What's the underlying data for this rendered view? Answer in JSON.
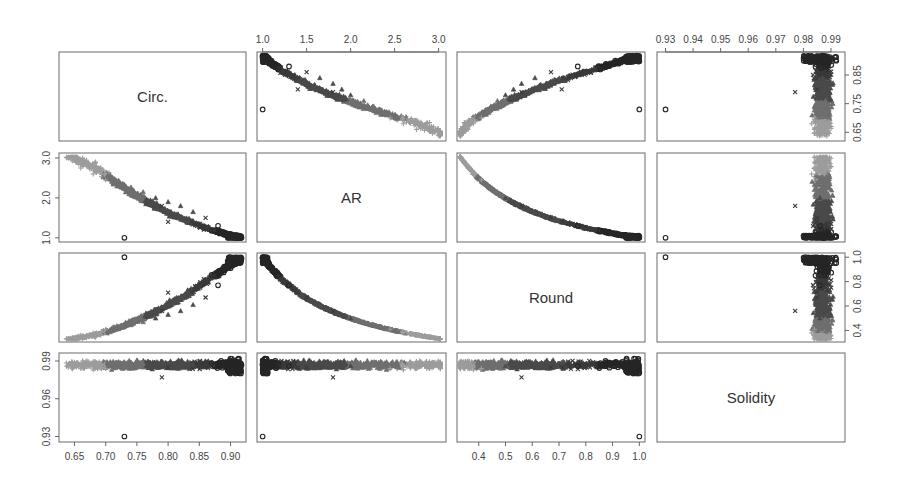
{
  "chart_data": {
    "type": "scatter",
    "subtype": "scatter_matrix",
    "title": "",
    "variables": [
      "Circ.",
      "AR",
      "Round",
      "Solidity"
    ],
    "ranges": {
      "Circ.": [
        0.63,
        0.92
      ],
      "AR": [
        0.97,
        3.05
      ],
      "Round": [
        0.33,
        1.01
      ],
      "Solidity": [
        0.928,
        0.994
      ]
    },
    "axes": {
      "top": [
        {
          "column": 1,
          "variable": "AR",
          "ticks": [
            "1.0",
            "1.5",
            "2.0",
            "2.5",
            "3.0"
          ]
        },
        {
          "column": 3,
          "variable": "Solidity",
          "ticks": [
            "0.93",
            "0.94",
            "0.95",
            "0.96",
            "0.97",
            "0.98",
            "0.99"
          ]
        }
      ],
      "bottom": [
        {
          "column": 0,
          "variable": "Circ.",
          "ticks": [
            "0.65",
            "0.70",
            "0.75",
            "0.80",
            "0.85",
            "0.90"
          ]
        },
        {
          "column": 2,
          "variable": "Round",
          "ticks": [
            "0.4",
            "0.5",
            "0.6",
            "0.7",
            "0.8",
            "0.9",
            "1.0"
          ]
        }
      ],
      "left": [
        {
          "row": 1,
          "variable": "AR",
          "ticks": [
            "1.0",
            "2.0",
            "3.0"
          ]
        },
        {
          "row": 3,
          "variable": "Solidity",
          "ticks": [
            "0.93",
            "0.96",
            "0.99"
          ]
        }
      ],
      "right": [
        {
          "row": 0,
          "variable": "Circ.",
          "ticks": [
            "0.65",
            "0.75",
            "0.85"
          ]
        },
        {
          "row": 2,
          "variable": "Round",
          "ticks": [
            "0.4",
            "0.6",
            "0.8",
            "1.0"
          ]
        }
      ]
    },
    "marker_groups": [
      {
        "name": "circles (dark, round cells)",
        "symbol": "o",
        "color": "#2a2a2a"
      },
      {
        "name": "crosses (outliers)",
        "symbol": "x",
        "color": "#3a3a3a"
      },
      {
        "name": "filled dark cluster",
        "symbol": "triangle",
        "color": "#3c3c3c"
      },
      {
        "name": "mid gray cluster",
        "symbol": "triangle",
        "color": "#6e6e6e"
      },
      {
        "name": "light gray elongated cells",
        "symbol": "+",
        "color": "#9a9a9a"
      }
    ],
    "relationships": {
      "Circ_vs_AR": "strong negative, near-linear from (0.64, 3.0) to (0.92, 1.0)",
      "Circ_vs_Round": "strong positive, curving up to Round=1.0 at Circ~0.92",
      "AR_vs_Round": "strong negative hyperbolic (Round ≈ 1/AR)",
      "Solidity": "concentrated 0.975–0.994 for all; two outliers near 0.93 (Circ≈0.73, AR≈1.0, Round≈1.0)"
    },
    "sample_points": [
      {
        "circ": 0.64,
        "ar": 3.0,
        "round": 0.33,
        "solidity": 0.985,
        "g": 4
      },
      {
        "circ": 0.66,
        "ar": 2.75,
        "round": 0.36,
        "solidity": 0.984,
        "g": 4
      },
      {
        "circ": 0.68,
        "ar": 2.6,
        "round": 0.38,
        "solidity": 0.983,
        "g": 4
      },
      {
        "circ": 0.7,
        "ar": 2.45,
        "round": 0.41,
        "solidity": 0.984,
        "g": 4
      },
      {
        "circ": 0.72,
        "ar": 2.35,
        "round": 0.43,
        "solidity": 0.988,
        "g": 3
      },
      {
        "circ": 0.74,
        "ar": 2.25,
        "round": 0.45,
        "solidity": 0.989,
        "g": 3
      },
      {
        "circ": 0.76,
        "ar": 2.15,
        "round": 0.47,
        "solidity": 0.988,
        "g": 3
      },
      {
        "circ": 0.78,
        "ar": 2.0,
        "round": 0.5,
        "solidity": 0.986,
        "g": 2
      },
      {
        "circ": 0.8,
        "ar": 1.9,
        "round": 0.53,
        "solidity": 0.985,
        "g": 2
      },
      {
        "circ": 0.82,
        "ar": 1.8,
        "round": 0.56,
        "solidity": 0.986,
        "g": 2
      },
      {
        "circ": 0.84,
        "ar": 1.65,
        "round": 0.61,
        "solidity": 0.987,
        "g": 2
      },
      {
        "circ": 0.86,
        "ar": 1.5,
        "round": 0.67,
        "solidity": 0.985,
        "g": 1
      },
      {
        "circ": 0.88,
        "ar": 1.3,
        "round": 0.77,
        "solidity": 0.986,
        "g": 0
      },
      {
        "circ": 0.9,
        "ar": 1.1,
        "round": 0.91,
        "solidity": 0.986,
        "g": 0
      },
      {
        "circ": 0.915,
        "ar": 1.02,
        "round": 0.98,
        "solidity": 0.987,
        "g": 0
      },
      {
        "circ": 0.73,
        "ar": 1.0,
        "round": 1.0,
        "solidity": 0.93,
        "g": 0
      },
      {
        "circ": 0.79,
        "ar": 1.8,
        "round": 0.56,
        "solidity": 0.977,
        "g": 1
      },
      {
        "circ": 0.8,
        "ar": 1.4,
        "round": 0.71,
        "solidity": 0.985,
        "g": 1
      }
    ]
  }
}
